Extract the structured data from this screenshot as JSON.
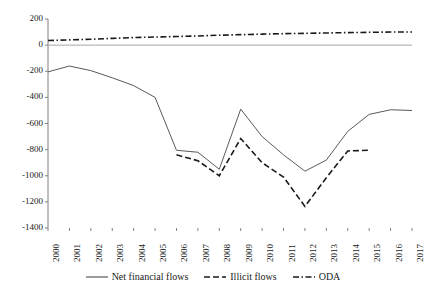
{
  "chart_data": {
    "type": "line",
    "title": "",
    "subtitle": "",
    "xlabel": "",
    "ylabel": "",
    "grid": false,
    "legend_position": "bottom",
    "categories": [
      "2000",
      "2001",
      "2002",
      "2003",
      "2004",
      "2005",
      "2006",
      "2007",
      "2008",
      "2009",
      "2010",
      "2011",
      "2012",
      "2013",
      "2014",
      "2015",
      "2016",
      "2017"
    ],
    "x": [
      2000,
      2001,
      2002,
      2003,
      2004,
      2005,
      2006,
      2007,
      2008,
      2009,
      2010,
      2011,
      2012,
      2013,
      2014,
      2015,
      2016,
      2017
    ],
    "xlim": [
      2000,
      2017
    ],
    "ylim": [
      -1400,
      200
    ],
    "ytick_labels": [
      "200",
      "0",
      "-200",
      "-400",
      "-600",
      "-800",
      "-1000",
      "-1200",
      "-1400"
    ],
    "ytick_values": [
      200,
      0,
      -200,
      -400,
      -600,
      -800,
      -1000,
      -1200,
      -1400
    ],
    "ytick_step": 200,
    "zero_line": 0,
    "series": [
      {
        "name": "Net financial flows",
        "style": "solid",
        "color": "#595959",
        "values": [
          -205,
          -160,
          -195,
          -250,
          -310,
          -400,
          -805,
          -820,
          -950,
          -490,
          -700,
          -840,
          -965,
          -880,
          -660,
          -530,
          -495,
          -500
        ]
      },
      {
        "name": "Illicit flows",
        "style": "dashed",
        "color": "#1a1a1a",
        "values": [
          null,
          null,
          null,
          null,
          null,
          null,
          -840,
          -885,
          -1000,
          -715,
          -900,
          -1010,
          -1235,
          -1015,
          -810,
          -805,
          null,
          null
        ]
      },
      {
        "name": "ODA",
        "style": "dash-dot",
        "color": "#1a1a1a",
        "values": [
          35,
          40,
          45,
          52,
          58,
          62,
          66,
          70,
          76,
          80,
          84,
          88,
          90,
          93,
          96,
          98,
          100,
          100
        ]
      }
    ]
  },
  "axes": {
    "y_ticks": [
      {
        "label": "200",
        "value": 200
      },
      {
        "label": "0",
        "value": 0
      },
      {
        "label": "-200",
        "value": -200
      },
      {
        "label": "-400",
        "value": -400
      },
      {
        "label": "-600",
        "value": -600
      },
      {
        "label": "-800",
        "value": -800
      },
      {
        "label": "-1000",
        "value": -1000
      },
      {
        "label": "-1200",
        "value": -1200
      },
      {
        "label": "-1400",
        "value": -1400
      }
    ],
    "x_ticks": [
      {
        "label": "2000"
      },
      {
        "label": "2001"
      },
      {
        "label": "2002"
      },
      {
        "label": "2003"
      },
      {
        "label": "2004"
      },
      {
        "label": "2005"
      },
      {
        "label": "2006"
      },
      {
        "label": "2007"
      },
      {
        "label": "2008"
      },
      {
        "label": "2009"
      },
      {
        "label": "2010"
      },
      {
        "label": "2011"
      },
      {
        "label": "2012"
      },
      {
        "label": "2013"
      },
      {
        "label": "2014"
      },
      {
        "label": "2015"
      },
      {
        "label": "2016"
      },
      {
        "label": "2017"
      }
    ]
  },
  "legend": {
    "items": [
      {
        "label": "Net financial flows",
        "style": "solid",
        "color": "#595959"
      },
      {
        "label": "Illicit flows",
        "style": "dashed",
        "color": "#1a1a1a"
      },
      {
        "label": "ODA",
        "style": "dash-dot",
        "color": "#1a1a1a"
      }
    ]
  }
}
